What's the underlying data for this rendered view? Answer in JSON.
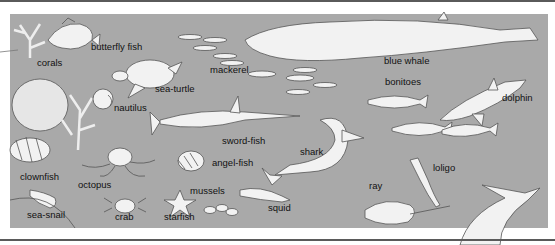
{
  "figure": {
    "background_color": "#a9a9a9",
    "outline_color": "#555555",
    "creature_fill": "#f2f2f2",
    "labels": [
      {
        "id": "butterfly-fish",
        "text": "butterfly fish",
        "x": 91,
        "y": 46
      },
      {
        "id": "corals",
        "text": "corals",
        "x": 37,
        "y": 62
      },
      {
        "id": "sea-turtle",
        "text": "sea-turtle",
        "x": 155,
        "y": 88
      },
      {
        "id": "mackerel",
        "text": "mackerel",
        "x": 210,
        "y": 69
      },
      {
        "id": "blue-whale",
        "text": "blue whale",
        "x": 384,
        "y": 60
      },
      {
        "id": "bonitoes",
        "text": "bonitoes",
        "x": 385,
        "y": 81
      },
      {
        "id": "dolphin",
        "text": "dolphin",
        "x": 502,
        "y": 97
      },
      {
        "id": "nautilus",
        "text": "nautilus",
        "x": 114,
        "y": 107
      },
      {
        "id": "sword-fish",
        "text": "sword-fish",
        "x": 222,
        "y": 140
      },
      {
        "id": "shark",
        "text": "shark",
        "x": 300,
        "y": 151
      },
      {
        "id": "angel-fish",
        "text": "angel-fish",
        "x": 212,
        "y": 162
      },
      {
        "id": "clownfish",
        "text": "clownfish",
        "x": 20,
        "y": 176
      },
      {
        "id": "octopus",
        "text": "octopus",
        "x": 78,
        "y": 184
      },
      {
        "id": "loligo",
        "text": "loligo",
        "x": 433,
        "y": 167
      },
      {
        "id": "mussels",
        "text": "mussels",
        "x": 190,
        "y": 190
      },
      {
        "id": "ray",
        "text": "ray",
        "x": 369,
        "y": 185
      },
      {
        "id": "squid",
        "text": "squid",
        "x": 268,
        "y": 207
      },
      {
        "id": "sea-snail",
        "text": "sea-snail",
        "x": 27,
        "y": 214
      },
      {
        "id": "crab",
        "text": "crab",
        "x": 115,
        "y": 216
      },
      {
        "id": "starfish",
        "text": "starfish",
        "x": 164,
        "y": 216
      }
    ]
  }
}
